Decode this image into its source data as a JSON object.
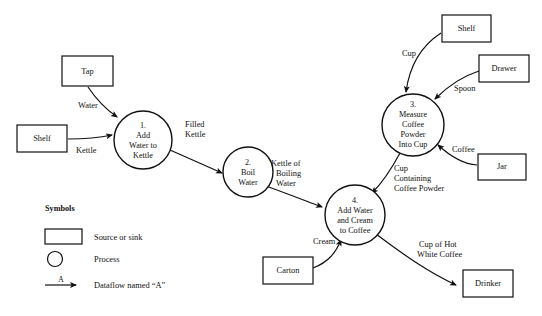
{
  "diagram": {
    "type": "data-flow-diagram",
    "external_entities": [
      {
        "id": "tap",
        "label": "Tap",
        "x": 62,
        "y": 56,
        "w": 51,
        "h": 30
      },
      {
        "id": "shelf-left",
        "label": "Shelf",
        "x": 17,
        "y": 125,
        "w": 50,
        "h": 27
      },
      {
        "id": "shelf-right",
        "label": "Shelf",
        "x": 442,
        "y": 15,
        "w": 49,
        "h": 27
      },
      {
        "id": "drawer",
        "label": "Drawer",
        "x": 479,
        "y": 55,
        "w": 50,
        "h": 27
      },
      {
        "id": "jar",
        "label": "Jar",
        "x": 478,
        "y": 154,
        "w": 48,
        "h": 26
      },
      {
        "id": "carton",
        "label": "Carton",
        "x": 263,
        "y": 257,
        "w": 50,
        "h": 27
      },
      {
        "id": "drinker",
        "label": "Drinker",
        "x": 463,
        "y": 270,
        "w": 50,
        "h": 27
      }
    ],
    "processes": [
      {
        "id": "p1",
        "number": "1.",
        "lines": [
          "1.",
          "Add",
          "Water to",
          "Kettle"
        ],
        "cx": 143,
        "cy": 140,
        "r": 29
      },
      {
        "id": "p2",
        "number": "2.",
        "lines": [
          "2.",
          "Boil",
          "Water"
        ],
        "cx": 248,
        "cy": 172,
        "r": 25
      },
      {
        "id": "p3",
        "number": "3.",
        "lines": [
          "3.",
          "Measure",
          "Coffee",
          "Powder",
          "Into Cup"
        ],
        "cx": 413,
        "cy": 125,
        "r": 31
      },
      {
        "id": "p4",
        "number": "4.",
        "lines": [
          "4.",
          "Add Water",
          "and Cream",
          "to Coffee"
        ],
        "cx": 355,
        "cy": 215,
        "r": 30
      }
    ],
    "dataflows": [
      {
        "id": "water",
        "label": "Water",
        "from": "tap",
        "to": "p1",
        "label_x": 78,
        "label_y": 108
      },
      {
        "id": "kettle",
        "label": "Kettle",
        "from": "shelf-left",
        "to": "p1",
        "label_x": 76,
        "label_y": 153
      },
      {
        "id": "filled-kettle",
        "label": [
          "Filled",
          "Kettle"
        ],
        "from": "p1",
        "to": "p2",
        "label_x": 185,
        "label_y": 127
      },
      {
        "id": "kettle-of-boiling-water",
        "label": [
          "Kettle of",
          "Boiling",
          "Water"
        ],
        "from": "p2",
        "to": "p4",
        "label_x": 273,
        "label_y": 166
      },
      {
        "id": "cup",
        "label": "Cup",
        "from": "shelf-right",
        "to": "p3",
        "label_x": 402,
        "label_y": 56
      },
      {
        "id": "spoon",
        "label": "Spoon",
        "from": "drawer",
        "to": "p3",
        "label_x": 454,
        "label_y": 91
      },
      {
        "id": "coffee",
        "label": "Coffee",
        "from": "jar",
        "to": "p3",
        "label_x": 452,
        "label_y": 152
      },
      {
        "id": "cup-containing-coffee-powder",
        "label": [
          "Cup",
          "Containing",
          "Coffee Powder"
        ],
        "from": "p3",
        "to": "p4",
        "label_x": 394,
        "label_y": 171
      },
      {
        "id": "cream",
        "label": "Cream",
        "from": "carton",
        "to": "p4",
        "label_x": 315,
        "label_y": 244
      },
      {
        "id": "cup-of-hot-white-coffee",
        "label": [
          "Cup of Hot",
          "White Coffee"
        ],
        "from": "p4",
        "to": "drinker",
        "label_x": 419,
        "label_y": 247
      }
    ]
  },
  "legend": {
    "title": "Symbols",
    "items": [
      {
        "id": "source-or-sink",
        "symbol": "rectangle",
        "label": "Source or sink"
      },
      {
        "id": "process",
        "symbol": "circle",
        "label": "Process"
      },
      {
        "id": "dataflow",
        "symbol": "arrow",
        "label": "Dataflow named “A”",
        "arrow_label": "A"
      }
    ]
  },
  "colors": {
    "stroke": "#111111",
    "background": "#ffffff"
  }
}
